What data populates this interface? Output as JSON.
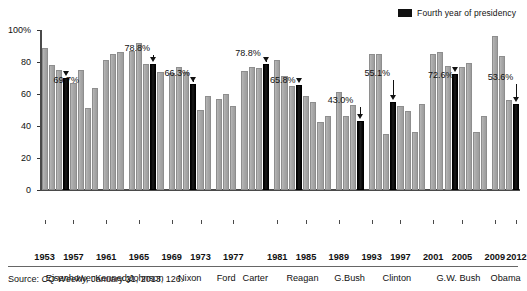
{
  "legend": {
    "label": "Fourth year of presidency",
    "swatch_color": "#111111"
  },
  "footer": {
    "source_prefix": "Source:",
    "source_italic": "CQ Weekly,",
    "source_rest": "January 21, 2013, 126."
  },
  "axes": {
    "y_ticks": [
      "100%",
      "80",
      "60",
      "40",
      "20",
      "0"
    ],
    "y_values": [
      100,
      80,
      60,
      40,
      20,
      0
    ],
    "x_ticks": [
      "1953",
      "1957",
      "1961",
      "1965",
      "1969",
      "1973",
      "1977",
      "1981",
      "1985",
      "1989",
      "1993",
      "1997",
      "2001",
      "2005",
      "2009",
      "2012"
    ],
    "presidents": [
      "Eisenhower",
      "Kennedy",
      "Johnson",
      "Nixon",
      "Ford",
      "Carter",
      "Reagan",
      "G.Bush",
      "Clinton",
      "G.W. Bush",
      "Obama"
    ]
  },
  "chart_data": {
    "type": "bar",
    "title": "",
    "xlabel": "",
    "ylabel": "",
    "ylim": [
      0,
      100
    ],
    "grid": false,
    "legend_position": "top-right",
    "categories": [
      "1953",
      "1954",
      "1955",
      "1956",
      "1957",
      "1958",
      "1959",
      "1960",
      "1961",
      "1962",
      "1963",
      "1964",
      "1965",
      "1966",
      "1967",
      "1968",
      "1969",
      "1970",
      "1971",
      "1972",
      "1973",
      "1974",
      "1975",
      "1976",
      "1977",
      "1978",
      "1979",
      "1980",
      "1981",
      "1982",
      "1983",
      "1984",
      "1985",
      "1986",
      "1987",
      "1988",
      "1989",
      "1990",
      "1991",
      "1992",
      "1993",
      "1994",
      "1995",
      "1996",
      "1997",
      "1998",
      "1999",
      "2000",
      "2001",
      "2002",
      "2003",
      "2004",
      "2005",
      "2006",
      "2007",
      "2008",
      "2009",
      "2010",
      "2011",
      "2012"
    ],
    "values": [
      89,
      78,
      75,
      69.7,
      67,
      75,
      52,
      64,
      81,
      85,
      86,
      87,
      92,
      79,
      78.8,
      74,
      73,
      77,
      74,
      66.3,
      52,
      59,
      58,
      60,
      53,
      76,
      77,
      77,
      78.8,
      82,
      72,
      66,
      65.8,
      63,
      59,
      47,
      51,
      62,
      46,
      53,
      43.0,
      86,
      86,
      36,
      55.1,
      53,
      53,
      38,
      53,
      87,
      87,
      77,
      72.6,
      78,
      45,
      38,
      96,
      89,
      57,
      53.6
    ],
    "highlight_label": "Fourth year of presidency",
    "highlight_color": "#111111",
    "bar_color": "#a8a8a8",
    "groups": [
      {
        "president": "Eisenhower",
        "start_year": 1953,
        "bars": [
          {
            "year": 1953,
            "value": 89.0,
            "fourth": false
          },
          {
            "year": 1954,
            "value": 78.0,
            "fourth": false
          },
          {
            "year": 1955,
            "value": 75.0,
            "fourth": false
          },
          {
            "year": 1956,
            "value": 69.7,
            "fourth": true,
            "label": "69.7%"
          },
          {
            "year": 1957,
            "value": 67.0,
            "fourth": false
          },
          {
            "year": 1958,
            "value": 75.0,
            "fourth": false
          },
          {
            "year": 1959,
            "value": 51.5,
            "fourth": false
          },
          {
            "year": 1960,
            "value": 64.0,
            "fourth": false
          }
        ]
      },
      {
        "president": "Kennedy",
        "start_year": 1961,
        "bars": [
          {
            "year": 1961,
            "value": 81.0,
            "fourth": false
          },
          {
            "year": 1962,
            "value": 85.0,
            "fourth": false
          },
          {
            "year": 1963,
            "value": 86.0,
            "fourth": false
          }
        ]
      },
      {
        "president": "Johnson",
        "start_year": 1964,
        "bars": [
          {
            "year": 1964,
            "value": 87.0,
            "fourth": false
          },
          {
            "year": 1965,
            "value": 92.0,
            "fourth": false
          },
          {
            "year": 1966,
            "value": 79.0,
            "fourth": false
          },
          {
            "year": 1967,
            "value": 78.8,
            "fourth": true,
            "label": "78.8%"
          },
          {
            "year": 1968,
            "value": 74.0,
            "fourth": false
          }
        ]
      },
      {
        "president": "Nixon",
        "start_year": 1969,
        "bars": [
          {
            "year": 1969,
            "value": 73.0,
            "fourth": false
          },
          {
            "year": 1970,
            "value": 77.0,
            "fourth": false
          },
          {
            "year": 1971,
            "value": 74.0,
            "fourth": false
          },
          {
            "year": 1972,
            "value": 66.3,
            "fourth": true,
            "label": "66.3%"
          },
          {
            "year": 1973,
            "value": 50.0,
            "fourth": false
          },
          {
            "year": 1974,
            "value": 58.5,
            "fourth": false
          }
        ]
      },
      {
        "president": "Ford",
        "start_year": 1975,
        "bars": [
          {
            "year": 1975,
            "value": 57.0,
            "fourth": false
          },
          {
            "year": 1976,
            "value": 60.0,
            "fourth": false
          },
          {
            "year": 1977,
            "value": 52.5,
            "fourth": false
          }
        ]
      },
      {
        "president": "Carter",
        "start_year": 1977,
        "bars": [
          {
            "year": 1977,
            "value": 74.5,
            "fourth": false
          },
          {
            "year": 1978,
            "value": 77.0,
            "fourth": false
          },
          {
            "year": 1979,
            "value": 76.0,
            "fourth": false
          },
          {
            "year": 1980,
            "value": 78.8,
            "fourth": true,
            "label": "78.8%"
          }
        ]
      },
      {
        "president": "Reagan",
        "start_year": 1981,
        "bars": [
          {
            "year": 1981,
            "value": 81.0,
            "fourth": false
          },
          {
            "year": 1982,
            "value": 71.5,
            "fourth": false
          },
          {
            "year": 1983,
            "value": 65.0,
            "fourth": false
          },
          {
            "year": 1984,
            "value": 65.8,
            "fourth": true,
            "label": "65.8%"
          },
          {
            "year": 1985,
            "value": 58.5,
            "fourth": false
          },
          {
            "year": 1986,
            "value": 55.0,
            "fourth": false
          },
          {
            "year": 1987,
            "value": 42.5,
            "fourth": false
          },
          {
            "year": 1988,
            "value": 46.0,
            "fourth": false
          }
        ]
      },
      {
        "president": "G.Bush",
        "start_year": 1989,
        "bars": [
          {
            "year": 1989,
            "value": 61.5,
            "fourth": false
          },
          {
            "year": 1990,
            "value": 46.0,
            "fourth": false
          },
          {
            "year": 1991,
            "value": 53.0,
            "fourth": false
          },
          {
            "year": 1992,
            "value": 43.0,
            "fourth": true,
            "label": "43.0%"
          }
        ]
      },
      {
        "president": "Clinton",
        "start_year": 1993,
        "bars": [
          {
            "year": 1993,
            "value": 85.0,
            "fourth": false
          },
          {
            "year": 1994,
            "value": 85.0,
            "fourth": false
          },
          {
            "year": 1995,
            "value": 35.0,
            "fourth": false
          },
          {
            "year": 1996,
            "value": 55.1,
            "fourth": true,
            "label": "55.1%"
          },
          {
            "year": 1997,
            "value": 52.5,
            "fourth": false
          },
          {
            "year": 1998,
            "value": 49.5,
            "fourth": false
          },
          {
            "year": 1999,
            "value": 36.5,
            "fourth": false
          },
          {
            "year": 2000,
            "value": 53.5,
            "fourth": false
          }
        ]
      },
      {
        "president": "G.W. Bush",
        "start_year": 2001,
        "bars": [
          {
            "year": 2001,
            "value": 85.0,
            "fourth": false
          },
          {
            "year": 2002,
            "value": 86.0,
            "fourth": false
          },
          {
            "year": 2003,
            "value": 77.5,
            "fourth": false
          },
          {
            "year": 2004,
            "value": 72.6,
            "fourth": true,
            "label": "72.6%"
          },
          {
            "year": 2005,
            "value": 77.0,
            "fourth": false
          },
          {
            "year": 2006,
            "value": 79.5,
            "fourth": false
          },
          {
            "year": 2007,
            "value": 36.5,
            "fourth": false
          },
          {
            "year": 2008,
            "value": 46.5,
            "fourth": false
          }
        ]
      },
      {
        "president": "Obama",
        "start_year": 2009,
        "bars": [
          {
            "year": 2009,
            "value": 96.0,
            "fourth": false
          },
          {
            "year": 2010,
            "value": 84.0,
            "fourth": false
          },
          {
            "year": 2011,
            "value": 56.0,
            "fourth": false
          },
          {
            "year": 2012,
            "value": 53.6,
            "fourth": true,
            "label": "53.6%"
          }
        ]
      }
    ],
    "callouts": [
      {
        "label": "69.7%",
        "president": "Eisenhower",
        "year": 1956
      },
      {
        "label": "78.8%",
        "president": "Johnson",
        "year": 1967
      },
      {
        "label": "66.3%",
        "president": "Nixon",
        "year": 1972
      },
      {
        "label": "78.8%",
        "president": "Carter",
        "year": 1980
      },
      {
        "label": "65.8%",
        "president": "Reagan",
        "year": 1984
      },
      {
        "label": "43.0%",
        "president": "G.Bush",
        "year": 1992
      },
      {
        "label": "55.1%",
        "president": "Clinton",
        "year": 1996
      },
      {
        "label": "72.6%",
        "president": "G.W. Bush",
        "year": 2004
      },
      {
        "label": "53.6%",
        "president": "Obama",
        "year": 2012
      }
    ]
  }
}
